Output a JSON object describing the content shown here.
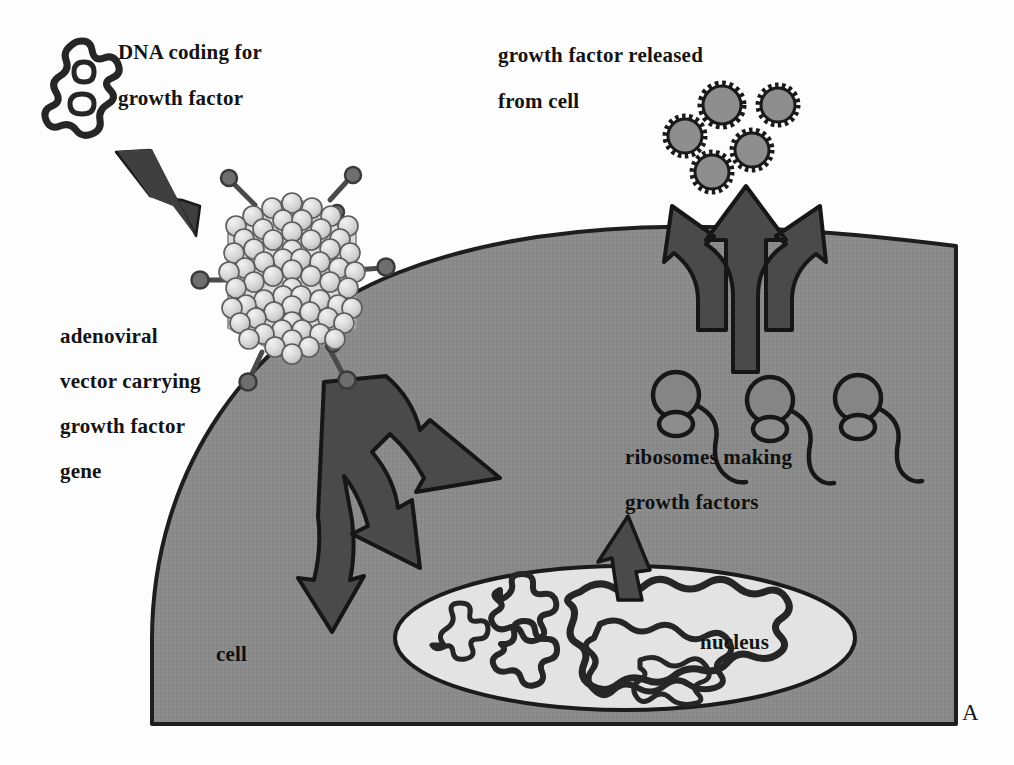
{
  "figure": {
    "panel_letter": "A",
    "title_concept": "adenoviral vector gene therapy",
    "background_color": "#fdfdfd"
  },
  "labels": {
    "dna_line1": "DNA coding for",
    "dna_line2": "growth factor",
    "released_line1": "growth factor released",
    "released_line2": "from cell",
    "vector_line1": "adenoviral",
    "vector_line2": "vector carrying",
    "vector_line3": "growth factor",
    "vector_line4": "gene",
    "ribosomes_line1": "ribosomes making",
    "ribosomes_line2": "growth factors",
    "cell": "cell",
    "nucleus": "nucleus"
  },
  "elements": {
    "dna_plasmid_icon": "dna-squiggle-icon",
    "adenovirus_icon": "adenovirus-capsid-icon",
    "growth_factor_icon": "growth-factor-particle-icon",
    "ribosome_icon": "ribosome-icon",
    "entry_arrow_icon": "trident-arrow-into-cell-icon",
    "exit_arrow_icon": "trident-arrow-out-of-cell-icon",
    "delivery_arrow_icon": "delivery-arrow-icon",
    "transcription_arrow_icon": "nucleus-to-cytoplasm-arrow-icon"
  },
  "counts": {
    "growth_factor_particles": 5,
    "ribosomes": 3,
    "nucleus_dna_strands": 4,
    "virus_fibers": 7,
    "entry_arrow_branches": 3,
    "exit_arrow_branches": 3
  },
  "colors": {
    "cell_cytoplasm": "#8a8a8a",
    "cell_outline": "#1e1e1e",
    "nucleus_fill": "#e3e3e3",
    "nucleus_outline": "#1b1b1b",
    "arrow_fill": "#4a4a4a",
    "arrow_outline": "#161616",
    "growth_factor_fill": "#8f8f8f",
    "capsid_fill": "#d9d9d9",
    "capsid_outline": "#4d4d4d",
    "dna_stroke": "#262626",
    "text": "#141414"
  },
  "geometry": {
    "cell_left_x": 152,
    "cell_right_x": 956,
    "cell_bottom_y": 724,
    "cell_apex_y": 246,
    "nucleus_center": [
      625,
      638
    ],
    "nucleus_radius": [
      230,
      72
    ],
    "virus_center": [
      292,
      277
    ],
    "ribosome_x": [
      672,
      765,
      855
    ]
  }
}
